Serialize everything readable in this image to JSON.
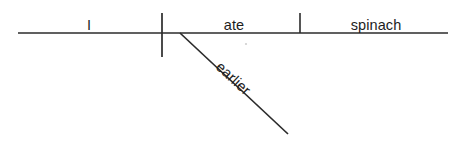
{
  "diagram": {
    "type": "reed-kellogg-sentence-diagram",
    "sentence": "I ate spinach earlier",
    "baseline": {
      "label": "baseline",
      "x1": 18,
      "y1": 33,
      "x2": 448,
      "y2": 33
    },
    "dividers": [
      {
        "name": "subject-verb-divider",
        "description": "full vertical line separating subject from verb",
        "x": 162,
        "y1": 13,
        "y2": 57
      },
      {
        "name": "verb-object-divider",
        "description": "short vertical line above baseline separating verb from direct object",
        "x": 300,
        "y1": 13,
        "y2": 33
      }
    ],
    "modifier_line": {
      "name": "adverb-slant-line",
      "x1": 180,
      "y1": 33,
      "x2": 288,
      "y2": 134
    },
    "words": [
      {
        "id": "subject",
        "text": "I",
        "role": "subject",
        "x": 89,
        "y": 30,
        "anchor": "middle",
        "rotation": 0
      },
      {
        "id": "verb",
        "text": "ate",
        "role": "verb",
        "x": 234,
        "y": 30,
        "anchor": "middle",
        "rotation": 0
      },
      {
        "id": "direct-object",
        "text": "spinach",
        "role": "direct object",
        "x": 376,
        "y": 30,
        "anchor": "middle",
        "rotation": 0
      },
      {
        "id": "adverb",
        "text": "earlier",
        "role": "adverb modifier",
        "x": 215,
        "y": 68,
        "anchor": "start",
        "rotation": 43
      }
    ],
    "colors": {
      "ink": "#2b2b2b",
      "text": "#1d1d1d",
      "background": "#ffffff",
      "speck": "#cfcfcf"
    },
    "artifact": {
      "name": "scan-speck",
      "x": 246,
      "y": 44,
      "r": 1.1
    }
  }
}
